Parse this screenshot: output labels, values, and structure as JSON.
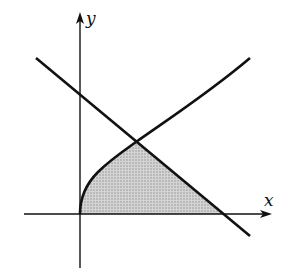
{
  "diagram": {
    "type": "region-between-curves",
    "axes": {
      "x_label": "x",
      "y_label": "y",
      "origin_px": [
        80,
        214
      ]
    },
    "curves": [
      {
        "name": "square-root-curve",
        "description": "increasing concave curve from origin, y ~ sqrt(x)"
      },
      {
        "name": "decreasing-line",
        "description": "straight line with negative slope crossing y-axis and x-axis"
      }
    ],
    "intersection_px": [
      136,
      142
    ],
    "shaded_region": {
      "description": "region bounded by curve, line, and x-axis",
      "fill": "#c8c8c8"
    },
    "colors": {
      "stroke": "#111111",
      "fill": "#c8c8c8"
    }
  }
}
